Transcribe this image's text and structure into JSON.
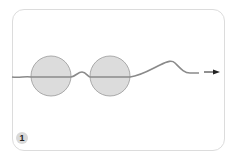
{
  "figure": {
    "step_number": "1",
    "colors": {
      "border": "#dcdcdc",
      "strand": "#8a8a8a",
      "bead_fill": "#dcdcdc",
      "bead_stroke": "#999999",
      "arrow": "#222222",
      "badge_fill": "#d9d9d9"
    },
    "elements": [
      "wavy-strand",
      "bead-left",
      "bead-right",
      "direction-arrow"
    ]
  }
}
